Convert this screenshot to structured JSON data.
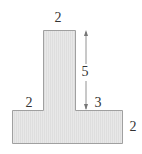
{
  "figure": {
    "shape": "T-shape",
    "fill_color": "#e6e6e6",
    "stroke_color": "#9a9a9a",
    "labels": {
      "stem_width": "2",
      "stem_height": "5",
      "left_overhang": "2",
      "right_overhang": "3",
      "base_height": "2"
    },
    "arrow": {
      "type": "double-headed",
      "meaning": "stem height",
      "value": "5"
    }
  }
}
